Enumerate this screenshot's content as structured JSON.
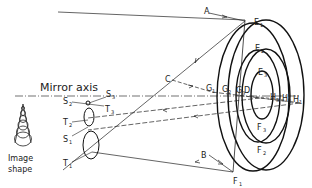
{
  "diagram": {
    "axis_label": "Mirror axis",
    "image_shape_label_line1": "Image",
    "image_shape_label_line2": "shape",
    "rays": {
      "A": "A",
      "B": "B",
      "C": "C",
      "D": "D"
    },
    "points": {
      "E1": {
        "base": "E",
        "sub": "1"
      },
      "E2": {
        "base": "E",
        "sub": "2"
      },
      "E3": {
        "base": "E",
        "sub": "3"
      },
      "F1": {
        "base": "F",
        "sub": "1"
      },
      "F2": {
        "base": "F",
        "sub": "2"
      },
      "F3": {
        "base": "F",
        "sub": "3"
      },
      "G1": {
        "base": "G",
        "sub": "1"
      },
      "G2": {
        "base": "G",
        "sub": "2"
      },
      "G3": {
        "base": "G",
        "sub": "3"
      },
      "H1": {
        "base": "H",
        "sub": "1"
      },
      "H2": {
        "base": "H",
        "sub": "2"
      },
      "H3": {
        "base": "H",
        "sub": "3"
      },
      "S1": {
        "base": "S",
        "sub": "1"
      },
      "S2": {
        "base": "S",
        "sub": "2"
      },
      "S3": {
        "base": "S",
        "sub": "3"
      },
      "T1": {
        "base": "T",
        "sub": "1"
      },
      "T2": {
        "base": "T",
        "sub": "2"
      },
      "T3": {
        "base": "T",
        "sub": "3"
      }
    },
    "colors": {
      "stroke": "#222222",
      "background": "#ffffff"
    }
  }
}
